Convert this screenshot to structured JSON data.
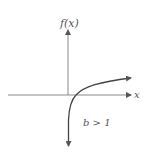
{
  "diagram": {
    "y_axis_label": "f(x)",
    "x_axis_label": "x",
    "condition_label": "b > 1",
    "function_type": "logarithmic",
    "colors": {
      "axis": "#8a8a8a",
      "curve": "#444444",
      "text": "#555555"
    }
  }
}
